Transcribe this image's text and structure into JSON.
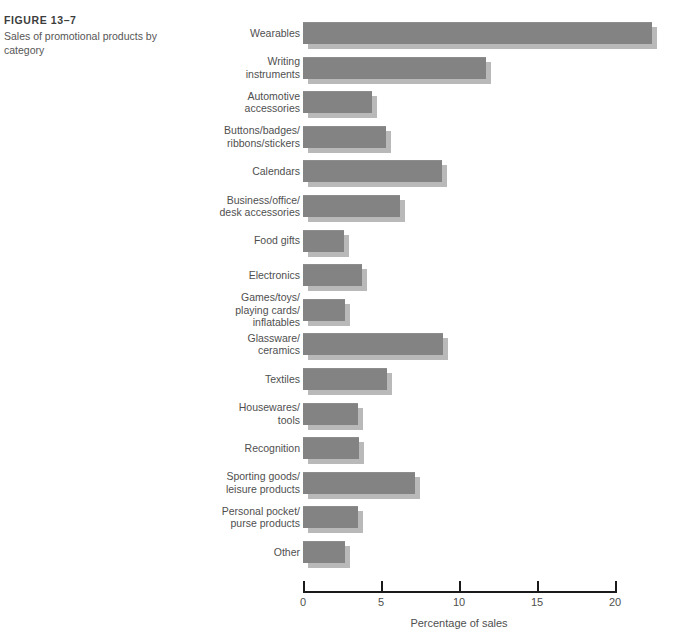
{
  "caption": {
    "figure_number": "FIGURE 13–7",
    "title": "Sales of promotional products by category"
  },
  "colors": {
    "bar": "#838383",
    "bar_shadow": "#b9b9b9",
    "axis": "#1a1a1a",
    "text": "#4f4f4f",
    "background": "#ffffff"
  },
  "chart_data": {
    "type": "bar",
    "orientation": "horizontal",
    "title": "Sales of promotional products by category",
    "xlabel": "Percentage of sales",
    "ylabel": "",
    "xlim": [
      0,
      20
    ],
    "xticks": [
      0,
      5,
      10,
      15,
      20
    ],
    "xtick_labels": [
      "0",
      "5",
      "10",
      "15",
      "20"
    ],
    "grid": false,
    "legend": "none",
    "categories": [
      "Wearables",
      "Writing\ninstruments",
      "Automotive\naccessories",
      "Buttons/badges/\nribbons/stickers",
      "Calendars",
      "Business/office/\ndesk accessories",
      "Food gifts",
      "Electronics",
      "Games/toys/\nplaying cards/\ninflatables",
      "Glassware/\nceramics",
      "Textiles",
      "Housewares/\ntools",
      "Recognition",
      "Sporting goods/\nleisure products",
      "Personal pocket/\npurse products",
      "Other"
    ],
    "values": [
      22.4,
      11.7,
      4.4,
      5.3,
      8.9,
      6.2,
      2.6,
      3.8,
      2.7,
      9.0,
      5.4,
      3.5,
      3.6,
      7.2,
      3.5,
      2.7
    ]
  }
}
